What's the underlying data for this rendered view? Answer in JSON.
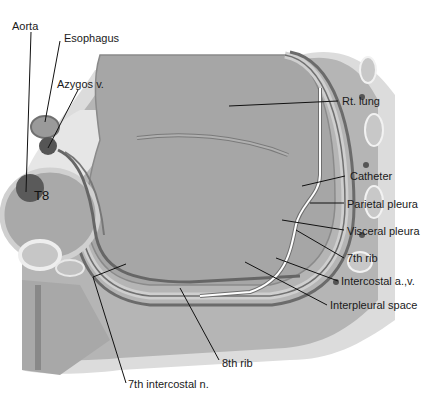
{
  "figure": {
    "labels": {
      "aorta": "Aorta",
      "esophagus": "Esophagus",
      "azygos": "Azygos v.",
      "rt_lung": "Rt. lung",
      "catheter": "Catheter",
      "parietal_pleura": "Parietal pleura",
      "visceral_pleura": "Visceral pleura",
      "rib7": "7th rib",
      "intercostal_av": "Intercostal a.,v.",
      "interpleural_space": "Interpleural space",
      "rib8": "8th rib",
      "intercostal_n": "7th intercostal n.",
      "vertebra": "T8"
    },
    "colors": {
      "lung": "#a9a9a9",
      "chest_wall": "#b9b9b9",
      "outer_skin": "#d9d9d9",
      "pleura_dark": "#6e6e6e",
      "vessel": "#4d4d4d",
      "rib_fill": "#c4c4c4",
      "line": "#111111"
    }
  }
}
